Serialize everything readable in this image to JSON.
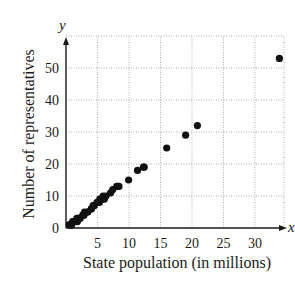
{
  "chart_data": {
    "type": "scatter",
    "title": "",
    "xlabel": "State population (in millions)",
    "ylabel": "Number of representatives",
    "x_axis_var": "x",
    "y_axis_var": "y",
    "xlim": [
      0,
      34.6
    ],
    "ylim": [
      0,
      60
    ],
    "x_ticks": [
      5,
      10,
      15,
      20,
      25,
      30
    ],
    "y_ticks": [
      0,
      10,
      20,
      30,
      40,
      50
    ],
    "grid": true,
    "legend": null,
    "series": [
      {
        "name": "States",
        "color": "#111111",
        "points": [
          [
            0.49,
            1
          ],
          [
            0.61,
            1
          ],
          [
            0.63,
            1
          ],
          [
            0.64,
            1
          ],
          [
            0.75,
            1
          ],
          [
            0.78,
            1
          ],
          [
            0.9,
            1
          ],
          [
            1.05,
            2
          ],
          [
            1.21,
            2
          ],
          [
            1.29,
            2
          ],
          [
            1.27,
            2
          ],
          [
            1.71,
            3
          ],
          [
            1.82,
            2
          ],
          [
            1.86,
            3
          ],
          [
            1.99,
            3
          ],
          [
            2.24,
            3
          ],
          [
            2.68,
            4
          ],
          [
            2.7,
            4
          ],
          [
            2.85,
            4
          ],
          [
            2.93,
            5
          ],
          [
            3.42,
            5
          ],
          [
            3.45,
            5
          ],
          [
            4.01,
            6
          ],
          [
            4.05,
            6
          ],
          [
            4.3,
            7
          ],
          [
            4.47,
            7
          ],
          [
            4.47,
            7
          ],
          [
            4.92,
            8
          ],
          [
            5.13,
            8
          ],
          [
            5.3,
            8
          ],
          [
            5.36,
            9
          ],
          [
            5.6,
            9
          ],
          [
            5.69,
            9
          ],
          [
            5.89,
            10
          ],
          [
            6.08,
            9
          ],
          [
            6.35,
            10
          ],
          [
            7.08,
            11
          ],
          [
            7.43,
            12
          ],
          [
            8.05,
            13
          ],
          [
            8.19,
            13
          ],
          [
            8.41,
            13
          ],
          [
            9.94,
            15
          ],
          [
            11.35,
            18
          ],
          [
            12.28,
            19
          ],
          [
            12.42,
            19
          ],
          [
            15.98,
            25
          ],
          [
            18.98,
            29
          ],
          [
            20.85,
            32
          ],
          [
            33.87,
            53
          ]
        ]
      }
    ]
  },
  "axes": {
    "x_var": "x",
    "y_var": "y",
    "x_tick_labels": [
      "5",
      "10",
      "15",
      "20",
      "25",
      "30"
    ],
    "y_tick_labels": [
      "0",
      "10",
      "20",
      "30",
      "40",
      "50"
    ],
    "x_title": "State population (in millions)",
    "y_title": "Number of representatives"
  }
}
